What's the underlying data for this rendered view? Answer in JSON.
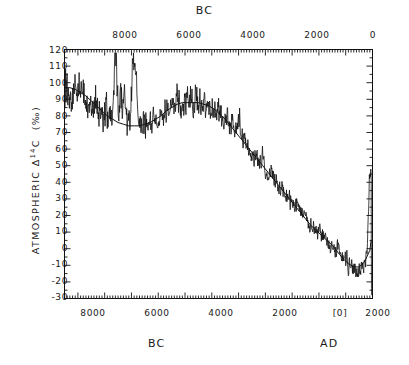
{
  "figure": {
    "top_title": "BC",
    "bottom_left_title": "BC",
    "bottom_right_title": "AD",
    "ylabel_prefix": "ATMOSPHERIC ",
    "ylabel_delta": "Δ",
    "ylabel_mass": "14",
    "ylabel_element": "C",
    "ylabel_units": "(‰)"
  },
  "chart_data": {
    "type": "line",
    "title": "",
    "subtitle": "",
    "xlabel": "BC / AD",
    "ylabel": "ATMOSPHERIC Δ14C (‰)",
    "grid": false,
    "legend": null,
    "axes": {
      "top": {
        "label": "BC",
        "tick_labels": [
          "8000",
          "6000",
          "4000",
          "2000",
          "0"
        ],
        "tick_values": [
          8000,
          6000,
          4000,
          2000,
          0
        ],
        "direction": "decreasing-left-to-right"
      },
      "bottom": {
        "labels": [
          "BC",
          "AD"
        ],
        "tick_labels": [
          "8000",
          "6000",
          "4000",
          "2000",
          "[0]",
          "2000"
        ],
        "tick_values": [
          -8000,
          -6000,
          -4000,
          -2000,
          0,
          2000
        ],
        "minor_ticks_per_major": 10
      },
      "left": {
        "tick_labels": [
          "120",
          "110",
          "100",
          "90",
          "80",
          "70",
          "60",
          "50",
          "40",
          "30",
          "20",
          "10",
          "0",
          "-10",
          "-20",
          "-30"
        ],
        "tick_values": [
          120,
          110,
          100,
          90,
          80,
          70,
          60,
          50,
          40,
          30,
          20,
          10,
          0,
          -10,
          -20,
          -30
        ],
        "ylim": [
          -30,
          120
        ]
      }
    },
    "xlim_years_bp_style": [
      -9500,
      2000
    ],
    "series": [
      {
        "name": "smoothed trend",
        "style": "solid-thin",
        "x": [
          -9500,
          -9300,
          -9100,
          -8900,
          -8700,
          -8500,
          -8300,
          -8100,
          -7900,
          -7700,
          -7500,
          -7300,
          -7100,
          -6900,
          -6700,
          -6500,
          -6300,
          -6100,
          -5900,
          -5700,
          -5500,
          -5300,
          -5100,
          -4900,
          -4700,
          -4500,
          -4300,
          -4100,
          -3900,
          -3700,
          -3500,
          -3300,
          -3100,
          -2900,
          -2700,
          -2500,
          -2300,
          -2100,
          -1900,
          -1700,
          -1500,
          -1300,
          -1100,
          -900,
          -700,
          -500,
          -300,
          -100,
          100,
          300,
          500,
          700,
          900,
          1100,
          1300,
          1500,
          1700,
          1900,
          1950
        ],
        "y": [
          97,
          97,
          96,
          94,
          92,
          89,
          86,
          83,
          80,
          78,
          76,
          75,
          74,
          74,
          74,
          75,
          76,
          78,
          80,
          83,
          85,
          87,
          88,
          88,
          88,
          88,
          87,
          86,
          84,
          81,
          78,
          74,
          70,
          66,
          62,
          58,
          54,
          50,
          46,
          42,
          38,
          34,
          30,
          26,
          22,
          18,
          14,
          11,
          8,
          5,
          2,
          -2,
          -6,
          -9,
          -11,
          -11,
          -8,
          -1,
          5
        ]
      },
      {
        "name": "measured Δ14C (decadal, noisy)",
        "style": "solid-jagged",
        "description": "High-frequency record oscillating about the smoothed trend, amplitude ~5-15 per mil, with notable spikes near 7600 BC (113), 6900 BC (109), and a sharp terminal drop after 1900 AD to about -25"
      }
    ],
    "notable_points": [
      {
        "label": "spike",
        "x": -7600,
        "y": 113
      },
      {
        "label": "spike",
        "x": -6900,
        "y": 109
      },
      {
        "label": "broad minimum",
        "x": -7100,
        "y": 74
      },
      {
        "label": "broad maximum",
        "x": -5000,
        "y": 88
      },
      {
        "label": "minimum",
        "x": 1500,
        "y": -12
      },
      {
        "label": "modern rise",
        "x": 1900,
        "y": 20
      },
      {
        "label": "Suess effect drop",
        "x": 1950,
        "y": -25
      }
    ]
  }
}
